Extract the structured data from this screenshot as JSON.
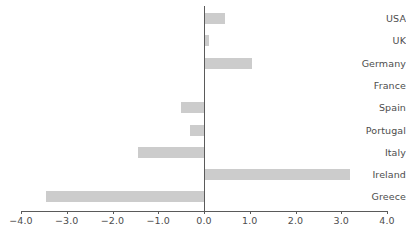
{
  "chart_data": {
    "type": "bar",
    "orientation": "horizontal",
    "title": "",
    "subtitle": "",
    "xlabel": "",
    "ylabel": "",
    "categories": [
      "USA",
      "UK",
      "Germany",
      "France",
      "Spain",
      "Portugal",
      "Italy",
      "Ireland",
      "Greece"
    ],
    "values": [
      0.45,
      0.1,
      1.05,
      0.0,
      -0.5,
      -0.3,
      -1.45,
      3.2,
      -3.45
    ],
    "xlim": [
      -4.0,
      4.0
    ],
    "xticks": [
      -4.0,
      -3.0,
      -2.0,
      -1.0,
      0.0,
      1.0,
      2.0,
      3.0,
      4.0
    ],
    "xtick_labels": [
      "-4.0",
      "-3.0",
      "-2.0",
      "-1.0",
      "0.0",
      "1.0",
      "2.0",
      "3.0",
      "4.0"
    ],
    "grid": false,
    "legend": null,
    "annotations": [],
    "colors": {
      "bar": "#cccccc",
      "axis": "#5a5a5a",
      "text": "#4d4d4d",
      "background": "#ffffff"
    }
  }
}
